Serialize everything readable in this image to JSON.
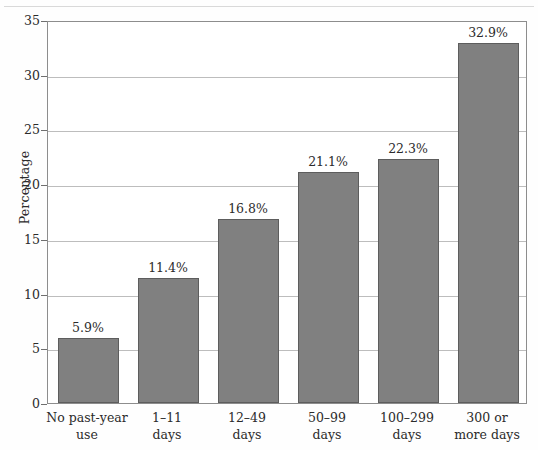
{
  "chart_data": {
    "type": "bar",
    "title": "",
    "xlabel": "",
    "ylabel": "Percentage",
    "ylim": [
      0,
      35
    ],
    "ytick_values": [
      0,
      5,
      10,
      15,
      20,
      25,
      30,
      35
    ],
    "ytick_labels": [
      "0",
      "5",
      "10",
      "15",
      "20",
      "25",
      "30",
      "35"
    ],
    "grid": true,
    "legend": false,
    "bar_color": "#808080",
    "bar_edge_color": "#5d5d5d",
    "grid_color": "#bdbdbd",
    "axis_color": "#8d8d8d",
    "categories": [
      "No past-year use",
      "1–11 days",
      "12–49 days",
      "50–99 days",
      "100–299 days",
      "300 or more days"
    ],
    "category_lines": [
      [
        "No past-year",
        "use"
      ],
      [
        "1–11",
        "days"
      ],
      [
        "12–49",
        "days"
      ],
      [
        "50–99",
        "days"
      ],
      [
        "100–299",
        "days"
      ],
      [
        "300 or",
        "more days"
      ]
    ],
    "values": [
      5.9,
      11.4,
      16.8,
      21.1,
      22.3,
      32.9
    ],
    "data_labels": [
      "5.9%",
      "11.4%",
      "16.8%",
      "21.1%",
      "22.3%",
      "32.9%"
    ]
  }
}
